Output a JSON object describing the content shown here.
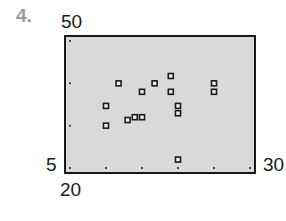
{
  "problem": {
    "number": "4."
  },
  "window": {
    "xmin": "20",
    "xmax": "30",
    "ymin": "5",
    "ymax": "50"
  },
  "colors": {
    "background": "#d9d9d9",
    "frame": "#1a1a1a",
    "marker": "#1a1a1a",
    "problem_number": "#9a9a9a"
  },
  "chart_data": {
    "type": "scatter",
    "title": "",
    "xlabel": "",
    "ylabel": "",
    "xlim": [
      20,
      30
    ],
    "ylim": [
      5,
      50
    ],
    "x_tick_marks": [
      20,
      22,
      24,
      26,
      28,
      30
    ],
    "y_tick_marks": [
      5,
      20,
      35,
      50
    ],
    "grid": false,
    "legend": null,
    "points": [
      {
        "x": 22.7,
        "y": 35
      },
      {
        "x": 24.0,
        "y": 32
      },
      {
        "x": 22.0,
        "y": 27
      },
      {
        "x": 23.2,
        "y": 22
      },
      {
        "x": 23.6,
        "y": 23
      },
      {
        "x": 24.0,
        "y": 23
      },
      {
        "x": 22.0,
        "y": 20
      },
      {
        "x": 24.7,
        "y": 35
      },
      {
        "x": 25.6,
        "y": 37.6
      },
      {
        "x": 25.6,
        "y": 32
      },
      {
        "x": 26.0,
        "y": 27
      },
      {
        "x": 26.0,
        "y": 24.4
      },
      {
        "x": 28.0,
        "y": 35
      },
      {
        "x": 28.0,
        "y": 32
      },
      {
        "x": 26.0,
        "y": 8
      }
    ]
  }
}
